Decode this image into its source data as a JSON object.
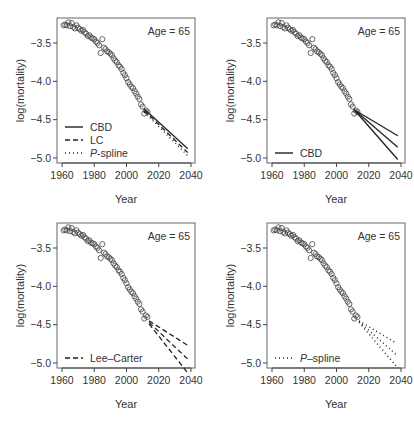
{
  "chart_data": [
    {
      "type": "scatter+line",
      "panel": "top-left",
      "annotation": "Age = 65",
      "xlabel": "Year",
      "ylabel": "log(mortality)",
      "xticks": [
        1960,
        1980,
        2000,
        2020,
        2040
      ],
      "yticks": [
        -3.5,
        -4.0,
        -4.5,
        -5.0
      ],
      "xlim": [
        1959,
        2041
      ],
      "ylim": [
        -5.07,
        -3.17
      ],
      "legend": [
        {
          "label": "CBD",
          "style": "solid"
        },
        {
          "label": "LC",
          "style": "dashed"
        },
        {
          "label": "P-spline",
          "style": "dotted"
        }
      ],
      "legend_position": "bottom-left",
      "series": [
        {
          "name": "CBD",
          "style": "solid",
          "x": [
            2011,
            2038
          ],
          "y": [
            -4.36,
            -4.88
          ]
        },
        {
          "name": "LC",
          "style": "dashed",
          "x": [
            2011,
            2038
          ],
          "y": [
            -4.38,
            -4.93
          ]
        },
        {
          "name": "P-spline",
          "style": "dotted",
          "x": [
            2011,
            2038
          ],
          "y": [
            -4.4,
            -4.97
          ]
        }
      ]
    },
    {
      "type": "scatter+line",
      "panel": "top-right",
      "annotation": "Age = 65",
      "xlabel": "Year",
      "ylabel": "log(mortality)",
      "xticks": [
        1960,
        1980,
        2000,
        2020,
        2040
      ],
      "yticks": [
        -3.5,
        -4.0,
        -4.5,
        -5.0
      ],
      "legend": [
        {
          "label": "CBD",
          "style": "solid"
        }
      ],
      "legend_position": "bottom-left",
      "series": [
        {
          "name": "CBD upper",
          "style": "solid",
          "x": [
            2011,
            2038
          ],
          "y": [
            -4.37,
            -4.71
          ]
        },
        {
          "name": "CBD central",
          "style": "solid",
          "x": [
            2011,
            2038
          ],
          "y": [
            -4.37,
            -4.86
          ]
        },
        {
          "name": "CBD lower",
          "style": "solid",
          "x": [
            2011,
            2038
          ],
          "y": [
            -4.37,
            -5.02
          ]
        }
      ]
    },
    {
      "type": "scatter+line",
      "panel": "bottom-left",
      "annotation": "Age = 65",
      "xlabel": "Year",
      "ylabel": "log(mortality)",
      "xticks": [
        1960,
        1980,
        2000,
        2020,
        2040
      ],
      "yticks": [
        -3.5,
        -4.0,
        -4.5,
        -5.0
      ],
      "legend": [
        {
          "label": "Lee–Carter",
          "style": "dashed"
        }
      ],
      "legend_position": "bottom-left",
      "series": [
        {
          "name": "LC upper",
          "style": "dashed",
          "x": [
            2014,
            2038
          ],
          "y": [
            -4.45,
            -4.77
          ]
        },
        {
          "name": "LC central",
          "style": "dashed",
          "x": [
            2014,
            2038
          ],
          "y": [
            -4.47,
            -4.95
          ]
        },
        {
          "name": "LC lower",
          "style": "dashed",
          "x": [
            2014,
            2038
          ],
          "y": [
            -4.49,
            -5.13
          ]
        }
      ]
    },
    {
      "type": "scatter+line",
      "panel": "bottom-right",
      "annotation": "Age = 65",
      "xlabel": "Year",
      "ylabel": "log(mortality)",
      "xticks": [
        1960,
        1980,
        2000,
        2020,
        2040
      ],
      "yticks": [
        -3.5,
        -4.0,
        -4.5,
        -5.0
      ],
      "legend": [
        {
          "label": "P–spline",
          "style": "dotted"
        }
      ],
      "legend_position": "bottom-left",
      "series": [
        {
          "name": "P-spline upper",
          "style": "dotted",
          "x": [
            2014,
            2037
          ],
          "y": [
            -4.45,
            -4.74
          ]
        },
        {
          "name": "P-spline central",
          "style": "dotted",
          "x": [
            2014,
            2037
          ],
          "y": [
            -4.46,
            -4.89
          ]
        },
        {
          "name": "P-spline lower",
          "style": "dotted",
          "x": [
            2014,
            2037
          ],
          "y": [
            -4.47,
            -5.04
          ]
        }
      ]
    }
  ],
  "observed": {
    "name": "observed log mortality, age 65",
    "x": [
      1961,
      1962,
      1963,
      1964,
      1965,
      1966,
      1967,
      1968,
      1969,
      1970,
      1971,
      1972,
      1973,
      1974,
      1975,
      1976,
      1977,
      1978,
      1979,
      1980,
      1981,
      1982,
      1983,
      1984,
      1985,
      1986,
      1987,
      1988,
      1989,
      1990,
      1991,
      1992,
      1993,
      1994,
      1995,
      1996,
      1997,
      1998,
      1999,
      2000,
      2001,
      2002,
      2003,
      2004,
      2005,
      2006,
      2007,
      2008,
      2009,
      2010,
      2011,
      2012,
      2013
    ],
    "y": [
      -3.27,
      -3.26,
      -3.27,
      -3.23,
      -3.28,
      -3.24,
      -3.29,
      -3.31,
      -3.27,
      -3.3,
      -3.32,
      -3.34,
      -3.33,
      -3.36,
      -3.38,
      -3.41,
      -3.4,
      -3.43,
      -3.44,
      -3.45,
      -3.48,
      -3.5,
      -3.53,
      -3.63,
      -3.45,
      -3.56,
      -3.58,
      -3.61,
      -3.62,
      -3.64,
      -3.66,
      -3.7,
      -3.73,
      -3.75,
      -3.79,
      -3.81,
      -3.84,
      -3.89,
      -3.92,
      -3.96,
      -4.01,
      -4.04,
      -4.07,
      -4.09,
      -4.13,
      -4.16,
      -4.2,
      -4.23,
      -4.3,
      -4.33,
      -4.42,
      -4.38,
      -4.4
    ]
  },
  "labels": {
    "age": "Age = 65",
    "xlabel": "Year",
    "ylabel": "log(mortality)",
    "xticks": [
      "1960",
      "1980",
      "2000",
      "2020",
      "2040"
    ],
    "yticks": [
      "-3.5",
      "-4.0",
      "-4.5",
      "-5.0"
    ],
    "tl_legend": [
      "CBD",
      "LC",
      "P",
      "-spline"
    ],
    "tr_legend": "CBD",
    "bl_legend": "Lee–Carter",
    "br_legend_p": "P",
    "br_legend_rest": "–spline"
  }
}
